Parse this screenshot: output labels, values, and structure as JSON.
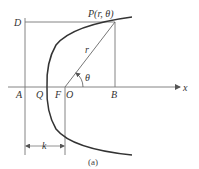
{
  "diagram": {
    "type": "polar-conic-parabola",
    "labels": {
      "point_p": "P(r, θ)",
      "d": "D",
      "a": "A",
      "q": "Q",
      "f": "F",
      "o": "O",
      "b": "B",
      "x_axis": "x",
      "r": "r",
      "theta": "θ",
      "k": "k"
    },
    "caption": "(a)",
    "colors": {
      "curve": "#333333",
      "lines": "#777777",
      "text": "#333333"
    }
  }
}
